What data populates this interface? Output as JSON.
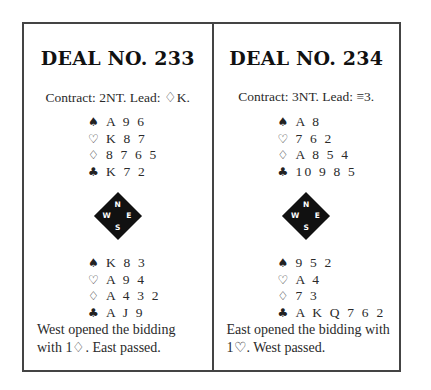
{
  "deals": [
    {
      "title": "DEAL NO. 233",
      "contract": "Contract: 2NT. Lead: ♢K.",
      "north": [
        {
          "suit": "♠",
          "suit_name": "spades",
          "cards": "A 9 6"
        },
        {
          "suit": "♡",
          "suit_name": "hearts",
          "cards": "K 8 7"
        },
        {
          "suit": "♢",
          "suit_name": "diamonds",
          "cards": "8 7 6 5"
        },
        {
          "suit": "♣",
          "suit_name": "clubs",
          "cards": "K 7 2"
        }
      ],
      "compass": {
        "n": "N",
        "s": "S",
        "w": "W",
        "e": "E"
      },
      "south": [
        {
          "suit": "♠",
          "suit_name": "spades",
          "cards": "K 8 3"
        },
        {
          "suit": "♡",
          "suit_name": "hearts",
          "cards": "A 9 4"
        },
        {
          "suit": "♢",
          "suit_name": "diamonds",
          "cards": "A 4 3 2"
        },
        {
          "suit": "♣",
          "suit_name": "clubs",
          "cards": "A J 9"
        }
      ],
      "footer": "West opened the bidding with 1♢. East passed."
    },
    {
      "title": "DEAL NO. 234",
      "contract": "Contract: 3NT. Lead: ≡3.",
      "north": [
        {
          "suit": "♠",
          "suit_name": "spades",
          "cards": "A 8"
        },
        {
          "suit": "♡",
          "suit_name": "hearts",
          "cards": "7 6 2"
        },
        {
          "suit": "♢",
          "suit_name": "diamonds",
          "cards": "A 8 5 4"
        },
        {
          "suit": "♣",
          "suit_name": "clubs",
          "cards": "10 9 8 5"
        }
      ],
      "compass": {
        "n": "N",
        "s": "S",
        "w": "W",
        "e": "E"
      },
      "south": [
        {
          "suit": "♠",
          "suit_name": "spades",
          "cards": "9 5 2"
        },
        {
          "suit": "♡",
          "suit_name": "hearts",
          "cards": "A 4"
        },
        {
          "suit": "♢",
          "suit_name": "diamonds",
          "cards": "7 3"
        },
        {
          "suit": "♣",
          "suit_name": "clubs",
          "cards": "A K Q 7 6 2"
        }
      ],
      "footer": "East opened the bidding with 1♡. West passed."
    }
  ]
}
